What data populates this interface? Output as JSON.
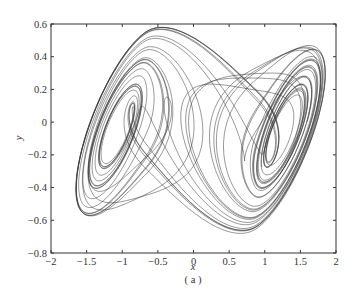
{
  "chart_data": {
    "type": "line",
    "title": "",
    "caption": "( a )",
    "xlabel": "x",
    "ylabel": "y",
    "xlim": [
      -2,
      2
    ],
    "ylim": [
      -0.8,
      0.6
    ],
    "xticks": [
      "-2",
      "-1.5",
      "-1",
      "-0.5",
      "0",
      "0.5",
      "1",
      "1.5",
      "2"
    ],
    "yticks": [
      "0.6",
      "0.4",
      "0.2",
      "0",
      "-0.2",
      "-0.4",
      "-0.6",
      "-0.8"
    ],
    "grid": false,
    "legend": null,
    "series": [
      {
        "name": "double-scroll attractor trajectory (x-y phase portrait)",
        "description": "Chaotic two-scroll attractor; left scroll centered near (-1.15, 0), right scroll centered near (1.2, 0.05); trajectory spans x ≈ -1.65..1.85, y ≈ -0.68..0.58",
        "left_scroll_center": [
          -1.15,
          0.0
        ],
        "right_scroll_center": [
          1.2,
          0.05
        ],
        "x_range": [
          -1.65,
          1.85
        ],
        "y_range": [
          -0.68,
          0.58
        ]
      }
    ]
  }
}
